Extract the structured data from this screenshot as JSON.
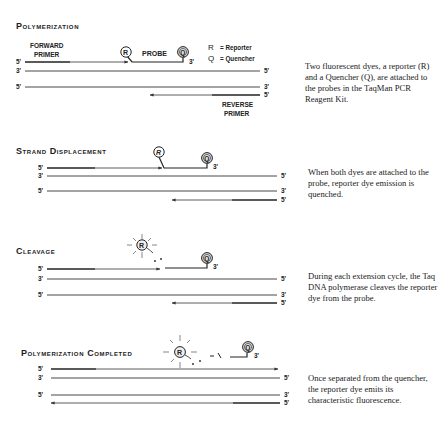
{
  "legend": {
    "r_symbol": "R",
    "r_label": "= Reporter",
    "q_symbol": "Q",
    "q_label": "= Quencher"
  },
  "labels": {
    "forward_primer_1": "FORWARD",
    "forward_primer_2": "PRIMER",
    "probe": "PROBE",
    "reverse_primer_1": "REVERSE",
    "reverse_primer_2": "PRIMER",
    "five_prime": "5'",
    "three_prime": "3'",
    "reporter": "R",
    "quencher": "Q"
  },
  "steps": [
    {
      "title": "Polymerization",
      "description": "Two fluorescent dyes, a reporter (R) and a Quencher (Q), are attached to the probes in the TaqMan PCR Reagent Kit."
    },
    {
      "title": "Strand Displacement",
      "description": "When both dyes are attached to the probe, reporter dye emission is quenched."
    },
    {
      "title": "Cleavage",
      "description": "During each extension cycle, the Taq DNA polymerase cleaves the reporter dye from the probe."
    },
    {
      "title": "Polymerization Completed",
      "description": "Once separated from the quencher, the reporter dye emits its characteristic fluorescence."
    }
  ],
  "colors": {
    "ink": "#222222",
    "line": "#333333",
    "dye_fill": "#cfcfcf"
  }
}
